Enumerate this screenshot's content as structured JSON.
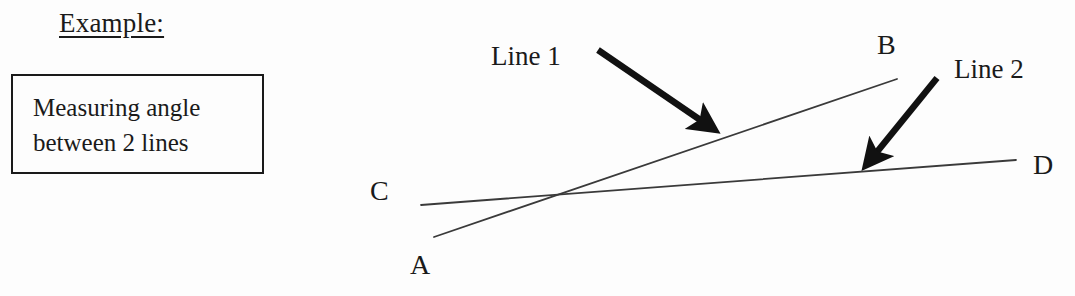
{
  "page": {
    "background_color": "#fdfdfd",
    "ink_color": "#1a1a1a"
  },
  "heading": {
    "text": "Example:",
    "underlined": true
  },
  "caption_box": {
    "text": "Measuring angle\nbetween 2 lines",
    "border_color": "#1a1a1a"
  },
  "diagram": {
    "type": "geometry-line-diagram",
    "point_labels": {
      "A": "A",
      "B": "B",
      "C": "C",
      "D": "D"
    },
    "annotations": {
      "line1": "Line 1",
      "line2": "Line 2"
    },
    "geometry": {
      "line1": {
        "from_label": "A",
        "to_label": "B",
        "x1": 434,
        "y1": 237,
        "x2": 897,
        "y2": 79
      },
      "line2": {
        "from_label": "C",
        "to_label": "D",
        "x1": 421,
        "y1": 205,
        "x2": 1016,
        "y2": 160
      },
      "intersection": {
        "x": 560,
        "y": 196
      },
      "arrow_line1": {
        "x1": 598,
        "y1": 50,
        "x2": 717,
        "y2": 132
      },
      "arrow_line2": {
        "x1": 937,
        "y1": 78,
        "x2": 863,
        "y2": 169
      }
    }
  }
}
